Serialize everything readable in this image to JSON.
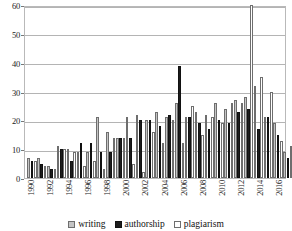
{
  "chart_data": {
    "type": "bar",
    "title": "",
    "xlabel": "",
    "ylabel": "",
    "ylim": [
      0,
      60
    ],
    "yticks": [
      0,
      10,
      20,
      30,
      40,
      50,
      60
    ],
    "grid": true,
    "legend_position": "bottom",
    "categories": [
      "1990",
      "1991",
      "1992",
      "1993",
      "1994",
      "1995",
      "1996",
      "1997",
      "1998",
      "1999",
      "2000",
      "2001",
      "2002",
      "2003",
      "2004",
      "2005",
      "2006",
      "2007",
      "2008",
      "2009",
      "2010",
      "2011",
      "2012",
      "2013",
      "2014",
      "2015",
      "2016"
    ],
    "tick_labels": [
      "1990",
      "",
      "1992",
      "",
      "1994",
      "",
      "1996",
      "",
      "1998",
      "",
      "2000",
      "",
      "2002",
      "",
      "2004",
      "",
      "2006",
      "",
      "2008",
      "",
      "2010",
      "",
      "2012",
      "",
      "2014",
      "",
      "2016"
    ],
    "series": [
      {
        "name": "writing",
        "color": "#c4c4c4",
        "values": [
          7,
          7,
          4,
          11,
          10,
          9,
          9,
          21,
          16,
          14,
          21,
          22,
          20,
          23,
          21,
          26,
          21,
          23,
          22,
          26,
          24,
          27,
          28,
          32,
          21,
          19,
          9
        ]
      },
      {
        "name": "authorship",
        "color": "#1c1c1c",
        "values": [
          6,
          5,
          3,
          10,
          6,
          12,
          12,
          9,
          9,
          14,
          14,
          20,
          20,
          18,
          22,
          39,
          21,
          19,
          17,
          20,
          19,
          23,
          24,
          17,
          21,
          15,
          7
        ]
      },
      {
        "name": "plagiarism",
        "color": "#ffffff",
        "values": [
          6,
          4,
          3,
          10,
          9,
          4,
          6,
          3,
          14,
          14,
          5,
          2,
          16,
          12,
          20,
          12,
          25,
          15,
          21,
          19,
          26,
          26,
          60,
          35,
          30,
          13,
          11
        ]
      }
    ],
    "legend": [
      "writing",
      "authorship",
      "plagiarism"
    ]
  }
}
